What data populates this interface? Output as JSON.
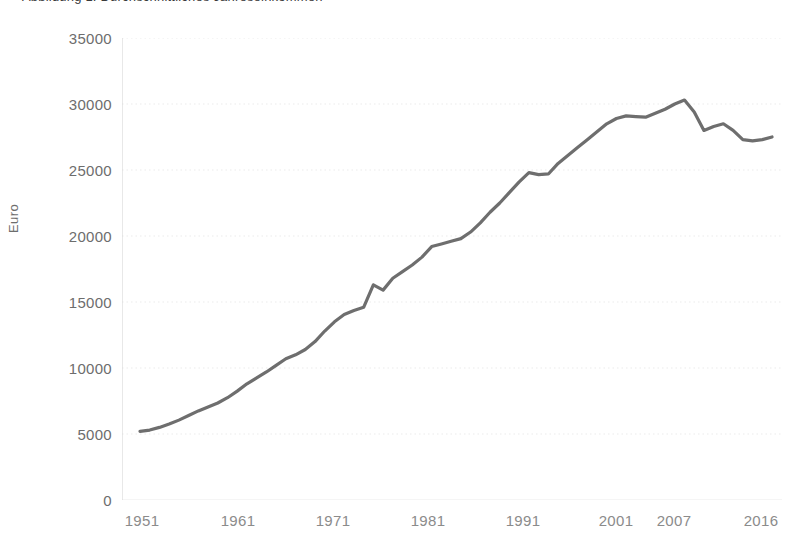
{
  "figure": {
    "title_partial": "Abbildung 1: Durchschnittliches Jahreseinkommen",
    "ylabel": "Euro"
  },
  "colors": {
    "line": "#6e6e6e",
    "grid": "#ebebeb",
    "axis": "#d8d8d8",
    "tick_text": "#6d6d6d",
    "xtick_text": "#8b8b8b"
  },
  "chart_data": {
    "type": "line",
    "title": "",
    "xlabel": "",
    "ylabel": "Euro",
    "ylim": [
      0,
      35000
    ],
    "xlim": [
      1951,
      2016
    ],
    "yticks": [
      0,
      5000,
      10000,
      15000,
      20000,
      25000,
      30000,
      35000
    ],
    "ytick_labels": [
      "0",
      "5000",
      "10000",
      "15000",
      "20000",
      "25000",
      "30000",
      "35000"
    ],
    "xticks": [
      1951,
      1961,
      1971,
      1981,
      1991,
      2001,
      2007,
      2016
    ],
    "xtick_labels": [
      "1951",
      "1961",
      "1971",
      "1981",
      "1991",
      "2001",
      "2007",
      "2016"
    ],
    "grid": "horizontal-dotted",
    "legend": "none",
    "x": [
      1951,
      1952,
      1953,
      1954,
      1955,
      1956,
      1957,
      1958,
      1959,
      1960,
      1961,
      1962,
      1963,
      1964,
      1965,
      1966,
      1967,
      1968,
      1969,
      1970,
      1971,
      1972,
      1973,
      1974,
      1975,
      1976,
      1977,
      1978,
      1979,
      1980,
      1981,
      1982,
      1983,
      1984,
      1985,
      1986,
      1987,
      1988,
      1989,
      1990,
      1991,
      1992,
      1993,
      1994,
      1995,
      1996,
      1997,
      1998,
      1999,
      2000,
      2001,
      2002,
      2003,
      2004,
      2005,
      2006,
      2007,
      2008,
      2009,
      2010,
      2011,
      2012,
      2013,
      2014,
      2015,
      2016
    ],
    "y": [
      5200,
      5300,
      5500,
      5750,
      6050,
      6400,
      6750,
      7050,
      7350,
      7750,
      8250,
      8800,
      9250,
      9700,
      10200,
      10700,
      11000,
      11400,
      12000,
      12800,
      13500,
      14050,
      14350,
      14600,
      16300,
      15900,
      16800,
      17300,
      17800,
      18400,
      19200,
      19400,
      19600,
      19800,
      20300,
      21000,
      21800,
      22500,
      23300,
      24100,
      24800,
      24650,
      24700,
      25500,
      26100,
      26700,
      27300,
      27900,
      28500,
      28900,
      29100,
      29050,
      29000,
      29300,
      29600,
      30000,
      30300,
      29400,
      28000,
      28300,
      28500,
      28000,
      27300,
      27200,
      27300,
      27500
    ],
    "series": [
      {
        "name": "Euro",
        "values": [
          5200,
          5300,
          5500,
          5750,
          6050,
          6400,
          6750,
          7050,
          7350,
          7750,
          8250,
          8800,
          9250,
          9700,
          10200,
          10700,
          11000,
          11400,
          12000,
          12800,
          13500,
          14050,
          14350,
          14600,
          16300,
          15900,
          16800,
          17300,
          17800,
          18400,
          19200,
          19400,
          19600,
          19800,
          20300,
          21000,
          21800,
          22500,
          23300,
          24100,
          24800,
          24650,
          24700,
          25500,
          26100,
          26700,
          27300,
          27900,
          28500,
          28900,
          29100,
          29050,
          29000,
          29300,
          29600,
          30000,
          30300,
          29400,
          28000,
          28300,
          28500,
          28000,
          27300,
          27200,
          27300,
          27500
        ]
      }
    ]
  }
}
